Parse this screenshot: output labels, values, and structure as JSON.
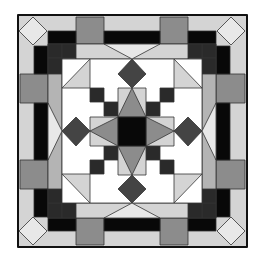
{
  "figure": {
    "colors": {
      "white": "#ffffff",
      "light": "#d4d4d4",
      "lighter": "#e8e8e8",
      "medium": "#8c8c8c",
      "midlight": "#b4b4b4",
      "dark": "#444444",
      "darker": "#2a2a2a",
      "black": "#080808",
      "line": "#333333"
    }
  }
}
